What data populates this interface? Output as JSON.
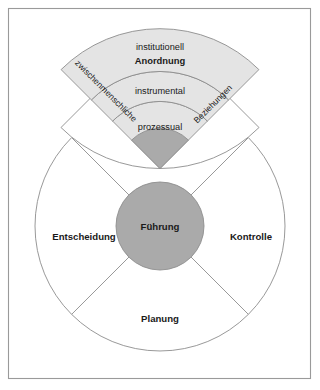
{
  "diagram": {
    "title_text": "",
    "colors": {
      "frame_border": "#9a9a9a",
      "shape_outline": "#8d8d8d",
      "band_fill": "#e4e4e4",
      "hub_fill": "#aaaaaa",
      "background": "#ffffff",
      "text": "#1a1a1a"
    },
    "fan": {
      "bands": [
        {
          "label": "institutionell",
          "emphasis": "Anordnung"
        },
        {
          "label": "instrumental",
          "emphasis": ""
        },
        {
          "label": "prozessual",
          "emphasis": ""
        }
      ],
      "side_labels": {
        "left": "zwischenmenschliche",
        "right": "Beziehungen"
      }
    },
    "wheel": {
      "hub_label": "Führung",
      "sectors": [
        {
          "label": "Entscheidung",
          "position": "left"
        },
        {
          "label": "Kontrolle",
          "position": "right"
        },
        {
          "label": "Planung",
          "position": "bottom"
        }
      ]
    }
  }
}
